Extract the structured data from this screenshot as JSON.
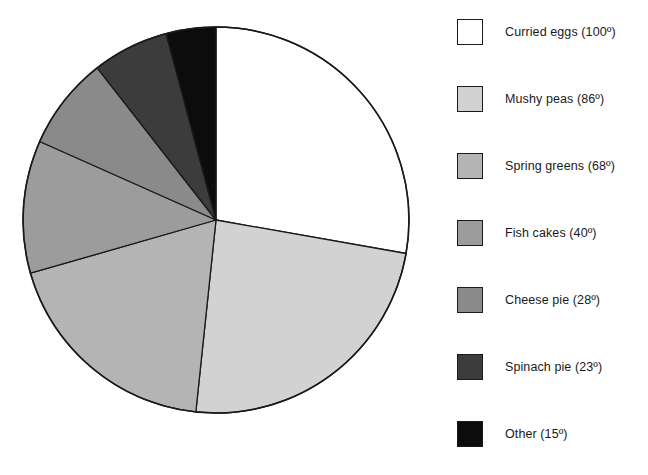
{
  "chart_data": {
    "type": "pie",
    "title": "",
    "subtitle": "",
    "xlabel": "",
    "ylabel": "",
    "units": "degrees",
    "total_degrees": 360,
    "start_angle_deg": 0,
    "direction": "clockwise",
    "grid": false,
    "legend_position": "right",
    "categories": [
      "Curried eggs",
      "Mushy peas",
      "Spring greens",
      "Fish cakes",
      "Cheese pie",
      "Spinach pie",
      "Other"
    ],
    "values": [
      100,
      86,
      68,
      40,
      28,
      23,
      15
    ],
    "slices": [
      {
        "label": "Curried eggs",
        "value": 100,
        "value_text": "100º",
        "legend_text": "Curried eggs (100º)",
        "color": "#ffffff",
        "start_deg": 0,
        "end_deg": 100
      },
      {
        "label": "Mushy peas",
        "value": 86,
        "value_text": "86º",
        "legend_text": "Mushy peas (86º)",
        "color": "#d2d2d2",
        "start_deg": 100,
        "end_deg": 186
      },
      {
        "label": "Spring greens",
        "value": 68,
        "value_text": "68º",
        "legend_text": "Spring greens (68º)",
        "color": "#b4b4b4",
        "start_deg": 186,
        "end_deg": 254
      },
      {
        "label": "Fish cakes",
        "value": 40,
        "value_text": "40º",
        "legend_text": "Fish cakes (40º)",
        "color": "#9c9c9c",
        "start_deg": 254,
        "end_deg": 294
      },
      {
        "label": "Cheese pie",
        "value": 28,
        "value_text": "28º",
        "legend_text": "Cheese pie (28º)",
        "color": "#8a8a8a",
        "start_deg": 294,
        "end_deg": 322
      },
      {
        "label": "Spinach pie",
        "value": 23,
        "value_text": "23º",
        "legend_text": "Spinach pie (23º)",
        "color": "#3c3c3c",
        "start_deg": 322,
        "end_deg": 345
      },
      {
        "label": "Other",
        "value": 15,
        "value_text": "15º",
        "legend_text": "Other (15º)",
        "color": "#0c0c0c",
        "start_deg": 345,
        "end_deg": 360
      }
    ]
  },
  "legend": {
    "items": [
      {
        "label": "Curried eggs (100º)",
        "color": "#ffffff",
        "swatch_name": "legend-swatch-curried-eggs"
      },
      {
        "label": "Mushy peas (86º)",
        "color": "#d2d2d2",
        "swatch_name": "legend-swatch-mushy-peas"
      },
      {
        "label": "Spring greens (68º)",
        "color": "#b4b4b4",
        "swatch_name": "legend-swatch-spring-greens"
      },
      {
        "label": "Fish cakes (40º)",
        "color": "#9c9c9c",
        "swatch_name": "legend-swatch-fish-cakes"
      },
      {
        "label": "Cheese pie (28º)",
        "color": "#8a8a8a",
        "swatch_name": "legend-swatch-cheese-pie"
      },
      {
        "label": "Spinach pie (23º)",
        "color": "#3c3c3c",
        "swatch_name": "legend-swatch-spinach-pie"
      },
      {
        "label": "Other (15º)",
        "color": "#0c0c0c",
        "swatch_name": "legend-swatch-other"
      }
    ]
  },
  "geometry": {
    "center_x": 216,
    "center_y": 220,
    "radius": 193,
    "outline_color": "#1a1a1a"
  }
}
